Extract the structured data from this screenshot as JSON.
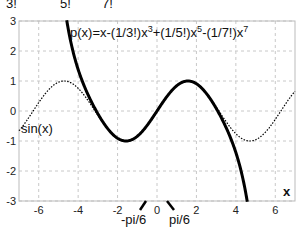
{
  "header_fragment": [
    "3!",
    "5!",
    "7!"
  ],
  "chart_data": {
    "type": "line",
    "title": "",
    "xlabel": "x",
    "ylabel": "",
    "xlim": [
      -7,
      7
    ],
    "ylim": [
      -3,
      3
    ],
    "grid": true,
    "grid_style": "dashed",
    "xticks": [
      -6,
      -4,
      -2,
      0,
      2,
      4,
      6
    ],
    "yticks": [
      -3,
      -2,
      -1,
      0,
      1,
      2,
      3
    ],
    "series": [
      {
        "name": "sin(x)",
        "style": "dotted",
        "color": "#000000",
        "function": "sin(x)",
        "label": "sin(x)"
      },
      {
        "name": "p(x)",
        "style": "solid-thick",
        "color": "#000000",
        "function": "x-(1/3!)x^3+(1/5!)x^5-(1/7!)x^7",
        "label": "p(x)=x-(1/3!)x^3+(1/5!)x^5-(1/7!)x^7"
      }
    ],
    "annotations": [
      {
        "text": "-pi/6",
        "x": -0.5236,
        "type": "axis-marker"
      },
      {
        "text": "pi/6",
        "x": 0.5236,
        "type": "axis-marker"
      }
    ]
  },
  "labels": {
    "formula_main": "p(x)=x-(1/3!)x",
    "formula_e3": "3",
    "formula_mid": "+(1/5!)x",
    "formula_e5": "5",
    "formula_mid2": "-(1/7!)x",
    "formula_e7": "7",
    "sin_label": "sin(x)",
    "x_axis": "x",
    "neg_pi6": "-pi/6",
    "pos_pi6": "pi/6"
  }
}
